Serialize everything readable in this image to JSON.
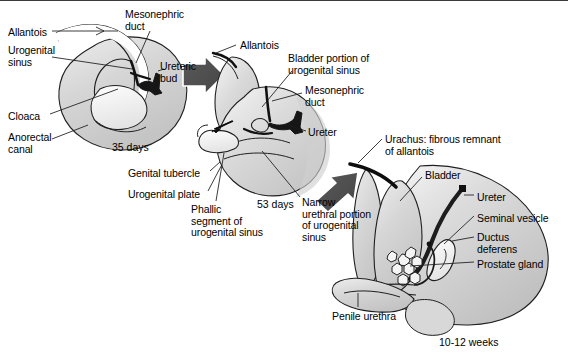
{
  "figure": {
    "background_color": "#ffffff",
    "tissue_fill": "#d2d2d2",
    "tissue_fill_light": "#e6e6e6",
    "duct_color": "#1a1a1a",
    "arrow_color": "#4d4d4d",
    "outline_color": "#1a1a1a"
  },
  "panels": [
    {
      "id": "panel-35-days",
      "stage": "35 days",
      "stage_pos": {
        "x": 112,
        "y": 141
      },
      "labels": [
        {
          "key": "allantois",
          "text": "Allantois",
          "x": 8,
          "y": 26
        },
        {
          "key": "urogenital-sinus",
          "text": "Urogenital\nsinus",
          "x": 8,
          "y": 44
        },
        {
          "key": "cloaca",
          "text": "Cloaca",
          "x": 8,
          "y": 110
        },
        {
          "key": "anorectal-canal",
          "text": "Anorectal\ncanal",
          "x": 8,
          "y": 131
        },
        {
          "key": "mesonephric-duct",
          "text": "Mesonephric\nduct",
          "x": 125,
          "y": 8
        },
        {
          "key": "ureteric-bud",
          "text": "Ureteric\nbud",
          "x": 160,
          "y": 60
        },
        {
          "key": "genital-tubercle",
          "text": "Genital tubercle",
          "x": 128,
          "y": 167
        },
        {
          "key": "urogenital-plate",
          "text": "Urogenital plate",
          "x": 128,
          "y": 188
        }
      ]
    },
    {
      "id": "panel-53-days",
      "stage": "53 days",
      "stage_pos": {
        "x": 257,
        "y": 198
      },
      "labels": [
        {
          "key": "allantois-2",
          "text": "Allantois",
          "x": 240,
          "y": 39
        },
        {
          "key": "bladder-portion",
          "text": "Bladder portion of\nurogenital sinus",
          "x": 288,
          "y": 52
        },
        {
          "key": "mesonephric-duct-2",
          "text": "Mesonephric\nduct",
          "x": 305,
          "y": 84
        },
        {
          "key": "ureter",
          "text": "Ureter",
          "x": 308,
          "y": 126
        },
        {
          "key": "phallic-segment",
          "text": "Phallic\nsegment of\nurogenital sinus",
          "x": 191,
          "y": 203
        },
        {
          "key": "narrow-urethral",
          "text": "Narrow\nurethral portion\nof urogenital\nsinus",
          "x": 302,
          "y": 196
        }
      ]
    },
    {
      "id": "panel-10-12-weeks",
      "stage": "10-12 weeks",
      "stage_pos": {
        "x": 439,
        "y": 336
      },
      "labels": [
        {
          "key": "urachus",
          "text": "Urachus: fibrous remnant\nof allantois",
          "x": 385,
          "y": 133
        },
        {
          "key": "bladder",
          "text": "Bladder",
          "x": 425,
          "y": 169
        },
        {
          "key": "ureter-2",
          "text": "Ureter",
          "x": 477,
          "y": 191
        },
        {
          "key": "seminal-vesicle",
          "text": "Seminal vesicle",
          "x": 477,
          "y": 212
        },
        {
          "key": "ductus-deferens",
          "text": "Ductus\ndeferens",
          "x": 477,
          "y": 231
        },
        {
          "key": "prostate-gland",
          "text": "Prostate gland",
          "x": 477,
          "y": 258
        },
        {
          "key": "penile-urethra",
          "text": "Penile urethra",
          "x": 332,
          "y": 310
        }
      ]
    }
  ],
  "arrows": [
    {
      "key": "arrow-1",
      "from_panel": "panel-35-days",
      "to_panel": "panel-53-days"
    },
    {
      "key": "arrow-2",
      "from_panel": "panel-53-days",
      "to_panel": "panel-10-12-weeks"
    }
  ]
}
